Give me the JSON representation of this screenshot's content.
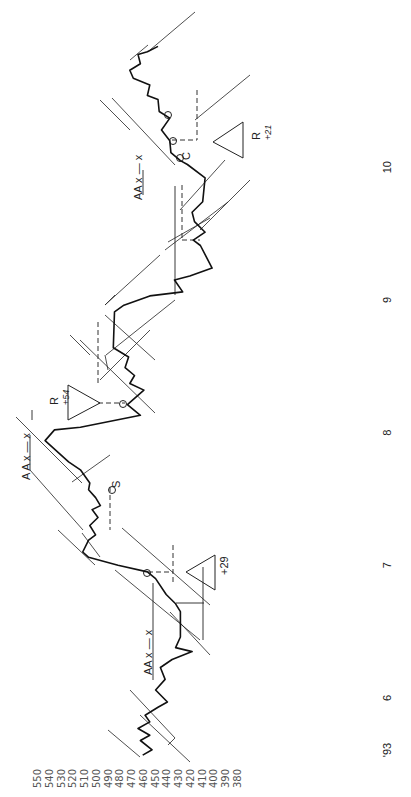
{
  "chart_data": {
    "type": "line",
    "orientation": "rotated-90 (time runs bottom-to-top, price runs left-to-right)",
    "title": "",
    "xlabel": "",
    "ylabel": "",
    "price_ticks": [
      "550",
      "540",
      "530",
      "520",
      "510",
      "500",
      "490",
      "480",
      "470",
      "460",
      "450",
      "440",
      "430",
      "420",
      "410",
      "400",
      "390",
      "380"
    ],
    "price_range": [
      550,
      380
    ],
    "time_labels": [
      {
        "label": "'93",
        "t": 5.6
      },
      {
        "label": "6",
        "t": 6
      },
      {
        "label": "7",
        "t": 7
      },
      {
        "label": "8",
        "t": 8
      },
      {
        "label": "9",
        "t": 9
      },
      {
        "label": "10",
        "t": 10
      }
    ],
    "grid": false,
    "legend": "none",
    "series": [
      {
        "name": "price",
        "t": [
          5.57,
          5.61,
          5.68,
          5.72,
          5.77,
          5.82,
          5.87,
          5.93,
          5.97,
          6.06,
          6.14,
          6.23,
          6.29,
          6.35,
          6.38,
          6.46,
          6.65,
          6.71,
          6.78,
          6.9,
          6.95,
          7.0,
          7.06,
          7.1,
          7.19,
          7.23,
          7.3,
          7.36,
          7.42,
          7.45,
          7.51,
          7.57,
          7.62,
          7.72,
          7.78,
          7.94,
          8.02,
          8.04,
          8.13,
          8.21,
          8.32,
          8.37,
          8.43,
          8.49,
          8.57,
          8.64,
          8.91,
          8.96,
          9.03,
          9.06,
          9.15,
          9.18,
          9.24,
          9.41,
          9.45,
          9.51,
          9.59,
          9.66,
          9.74,
          9.92,
          10.02,
          10.05,
          10.11,
          10.2,
          10.28,
          10.37,
          10.42,
          10.51,
          10.54,
          10.62,
          10.67,
          10.73,
          10.78,
          10.85,
          10.87,
          10.91
        ],
        "values": [
          461,
          453,
          463,
          455,
          465,
          455,
          459,
          448,
          440,
          450,
          442,
          446,
          436,
          419,
          433,
          429,
          429,
          433,
          441,
          450,
          457,
          482,
          507,
          512,
          507,
          501,
          506,
          499,
          504,
          497,
          501,
          507,
          506,
          514,
          524,
          544,
          536,
          514,
          463,
          474,
          460,
          472,
          468,
          476,
          473,
          486,
          485,
          477,
          455,
          427,
          434,
          421,
          402,
          412,
          418,
          408,
          417,
          419,
          410,
          408,
          423,
          429,
          437,
          438,
          445,
          438,
          447,
          448,
          457,
          455,
          469,
          472,
          463,
          465,
          457,
          448
        ]
      }
    ],
    "annotations": [
      {
        "id": "aa-1",
        "text": "AA",
        "marks": "x — x",
        "t": 6.5
      },
      {
        "id": "triangle-1",
        "text": "+29",
        "t": 7.0
      },
      {
        "id": "marker-s",
        "text": "S",
        "t": 7.7
      },
      {
        "id": "aa-2",
        "text": "A A",
        "marks": "x — x",
        "t": 8.0
      },
      {
        "id": "triangle-2",
        "label": "R",
        "text": "+54",
        "t": 8.4
      },
      {
        "id": "aa-3",
        "text": "AA",
        "marks": "x — x",
        "t": 10.0
      },
      {
        "id": "marker-c",
        "text": "C",
        "t": 10.0
      },
      {
        "id": "triangle-3",
        "label": "R",
        "text": "+21",
        "t": 10.3
      }
    ]
  }
}
